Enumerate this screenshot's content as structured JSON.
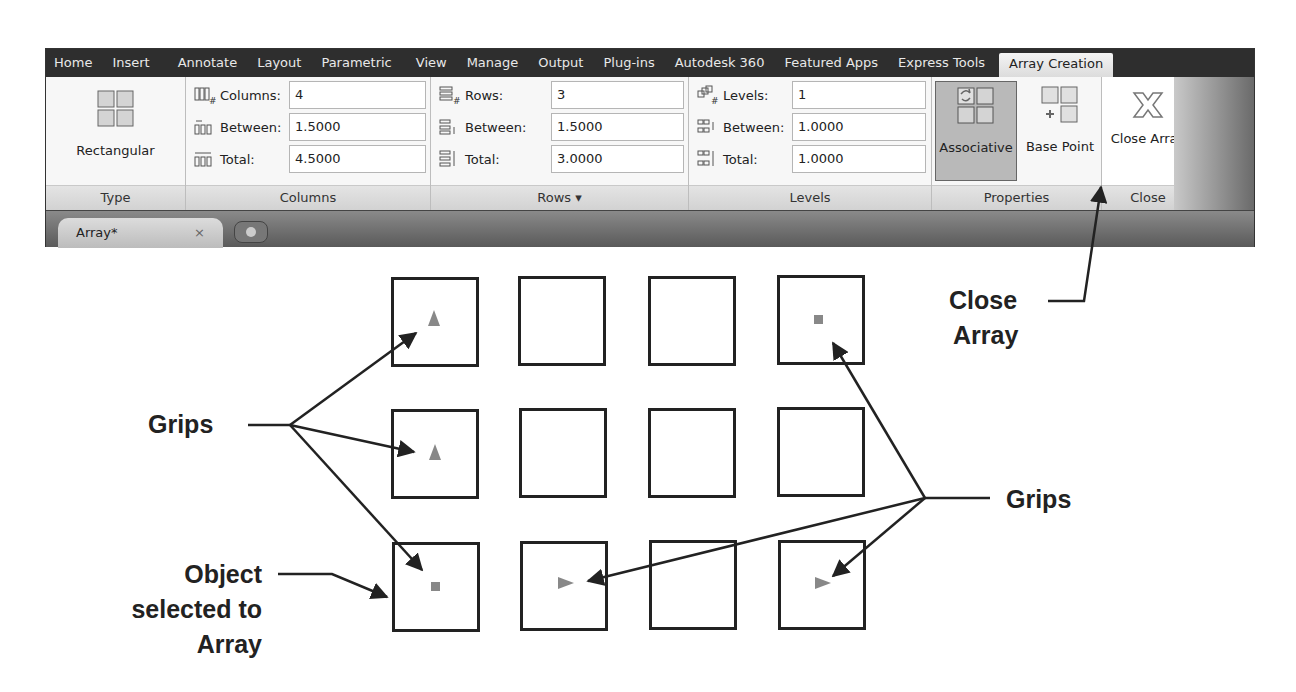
{
  "ribbon": {
    "tabs": [
      {
        "label": "Home"
      },
      {
        "label": "Insert"
      },
      {
        "label": "Annotate"
      },
      {
        "label": "Layout"
      },
      {
        "label": "Parametric"
      },
      {
        "label": "View"
      },
      {
        "label": "Manage"
      },
      {
        "label": "Output"
      },
      {
        "label": "Plug-ins"
      },
      {
        "label": "Autodesk 360"
      },
      {
        "label": "Featured Apps"
      },
      {
        "label": "Express Tools"
      },
      {
        "label": "Array Creation",
        "active": true
      }
    ],
    "panels": {
      "type": {
        "title": "Type",
        "button_label": "Rectangular"
      },
      "columns": {
        "title": "Columns",
        "fields": [
          {
            "label": "Columns:",
            "value": "4",
            "icon": "columns-count-icon"
          },
          {
            "label": "Between:",
            "value": "1.5000",
            "icon": "columns-between-icon"
          },
          {
            "label": "Total:",
            "value": "4.5000",
            "icon": "columns-total-icon"
          }
        ]
      },
      "rows": {
        "title": "Rows ▾",
        "fields": [
          {
            "label": "Rows:",
            "value": "3",
            "icon": "rows-count-icon"
          },
          {
            "label": "Between:",
            "value": "1.5000",
            "icon": "rows-between-icon"
          },
          {
            "label": "Total:",
            "value": "3.0000",
            "icon": "rows-total-icon"
          }
        ]
      },
      "levels": {
        "title": "Levels",
        "fields": [
          {
            "label": "Levels:",
            "value": "1",
            "icon": "levels-count-icon"
          },
          {
            "label": "Between:",
            "value": "1.0000",
            "icon": "levels-between-icon"
          },
          {
            "label": "Total:",
            "value": "1.0000",
            "icon": "levels-total-icon"
          }
        ]
      },
      "properties": {
        "title": "Properties",
        "associative_label": "Associative",
        "base_point_label": "Base Point"
      },
      "close": {
        "title": "Close",
        "button_label": "Close Array"
      }
    }
  },
  "document_tabs": {
    "active_tab": "Array*",
    "close_glyph": "×"
  },
  "drawing": {
    "grid": {
      "rows": 3,
      "columns": 4
    },
    "grips": [
      {
        "row": 1,
        "col": 1,
        "shape": "triangle-up"
      },
      {
        "row": 1,
        "col": 4,
        "shape": "square"
      },
      {
        "row": 2,
        "col": 1,
        "shape": "triangle-up"
      },
      {
        "row": 3,
        "col": 1,
        "shape": "square"
      },
      {
        "row": 3,
        "col": 2,
        "shape": "triangle-right"
      },
      {
        "row": 3,
        "col": 4,
        "shape": "triangle-right"
      }
    ],
    "grip_color": "#888888"
  },
  "annotations": {
    "close_array": {
      "line1": "Close",
      "line2": "Array"
    },
    "grips_left": "Grips",
    "grips_right": "Grips",
    "object_selected": {
      "line1": "Object",
      "line2": "selected to",
      "line3": "Array"
    }
  }
}
